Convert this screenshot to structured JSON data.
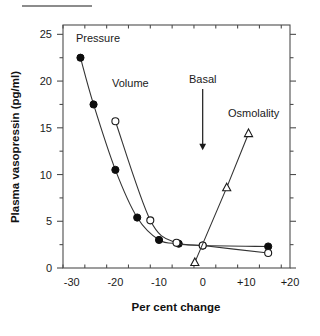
{
  "figure": {
    "caption_rule": "caption-underline"
  },
  "chart_data": {
    "type": "line",
    "title": "",
    "xlabel": "Per cent change",
    "ylabel": "Plasma vasopressin (pg/ml)",
    "xlim": [
      -32,
      20
    ],
    "ylim": [
      0,
      26
    ],
    "xticks": [
      -30,
      -20,
      -10,
      0,
      10,
      20
    ],
    "xticklabels": [
      "-30",
      "-20",
      "-10",
      "0",
      "+10",
      "+20"
    ],
    "yticks": [
      0,
      5,
      10,
      15,
      20,
      25
    ],
    "yticklabels": [
      "0",
      "5",
      "10",
      "15",
      "20",
      "25"
    ],
    "minor_tick_step_x": 5,
    "minor_tick_step_y": 2.5,
    "grid": false,
    "legend": "inline-labels",
    "series": [
      {
        "name": "Pressure",
        "marker": "filled-circle",
        "label_text": "Pressure",
        "x": [
          -28,
          -25,
          -20,
          -15,
          -10,
          -5.5,
          0,
          15
        ],
        "y": [
          22.5,
          17.5,
          10.5,
          5.4,
          3.0,
          2.6,
          2.4,
          2.3
        ]
      },
      {
        "name": "Volume",
        "marker": "open-circle",
        "label_text": "Volume",
        "x": [
          -20,
          -12,
          -6,
          0,
          15
        ],
        "y": [
          15.7,
          5.1,
          2.7,
          2.4,
          1.6
        ]
      },
      {
        "name": "Osmolality",
        "marker": "open-triangle",
        "label_text": "Osmolality",
        "x": [
          -1.8,
          5.5,
          10.5
        ],
        "y": [
          0.6,
          8.6,
          14.4
        ]
      }
    ],
    "annotations": [
      {
        "text": "Basal",
        "x": 0,
        "y": 19.8,
        "arrow_to_y": 12.6
      }
    ]
  }
}
